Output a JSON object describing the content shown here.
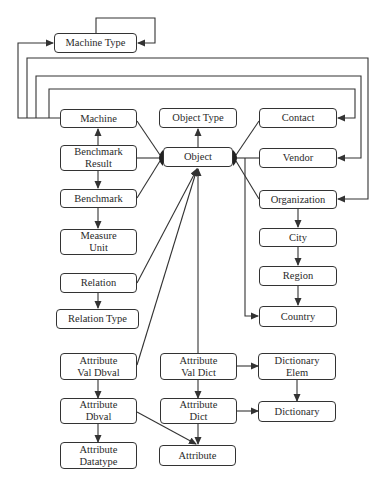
{
  "diagram": {
    "type": "entity-relationship",
    "colors": {
      "line": "#333333",
      "box_border": "#333333",
      "text": "#2a2a2a",
      "background": "#ffffff"
    },
    "nodes": {
      "machine_type": {
        "label": "Machine Type"
      },
      "machine": {
        "label": "Machine"
      },
      "object_type": {
        "label": "Object Type"
      },
      "contact": {
        "label": "Contact"
      },
      "benchmark_result": {
        "label": "Benchmark\nResult"
      },
      "object": {
        "label": "Object"
      },
      "vendor": {
        "label": "Vendor"
      },
      "benchmark": {
        "label": "Benchmark"
      },
      "organization": {
        "label": "Organization"
      },
      "measure_unit": {
        "label": "Measure\nUnit"
      },
      "city": {
        "label": "City"
      },
      "relation": {
        "label": "Relation"
      },
      "region": {
        "label": "Region"
      },
      "relation_type": {
        "label": "Relation Type"
      },
      "country": {
        "label": "Country"
      },
      "attribute_val_dbval": {
        "label": "Attribute\nVal Dbval"
      },
      "attribute_val_dict": {
        "label": "Attribute\nVal Dict"
      },
      "dictionary_elem": {
        "label": "Dictionary\nElem"
      },
      "attribute_dbval": {
        "label": "Attribute\nDbval"
      },
      "attribute_dict": {
        "label": "Attribute\nDict"
      },
      "dictionary": {
        "label": "Dictionary"
      },
      "attribute_datatype": {
        "label": "Attribute\nDatatype"
      },
      "attribute": {
        "label": "Attribute"
      }
    },
    "edges": [
      {
        "from": "Machine Type",
        "to": "Machine Type",
        "kind": "self-loop"
      },
      {
        "from": "Machine",
        "to": "Machine Type"
      },
      {
        "from": "Machine",
        "to": "Contact"
      },
      {
        "from": "Machine",
        "to": "Vendor"
      },
      {
        "from": "Machine",
        "to": "Organization"
      },
      {
        "from": "Benchmark Result",
        "to": "Machine"
      },
      {
        "from": "Benchmark Result",
        "to": "Benchmark"
      },
      {
        "from": "Benchmark",
        "to": "Measure Unit"
      },
      {
        "from": "Object",
        "to": "Object Type"
      },
      {
        "from": "Machine",
        "to": "Object",
        "kind": "inheritance"
      },
      {
        "from": "Benchmark Result",
        "to": "Object",
        "kind": "inheritance"
      },
      {
        "from": "Benchmark",
        "to": "Object",
        "kind": "inheritance"
      },
      {
        "from": "Contact",
        "to": "Object",
        "kind": "inheritance"
      },
      {
        "from": "Vendor",
        "to": "Object",
        "kind": "inheritance"
      },
      {
        "from": "Organization",
        "to": "Object",
        "kind": "inheritance"
      },
      {
        "from": "Country",
        "to": "Object",
        "kind": "inheritance"
      },
      {
        "from": "Organization",
        "to": "City"
      },
      {
        "from": "City",
        "to": "Region"
      },
      {
        "from": "Region",
        "to": "Country"
      },
      {
        "from": "Relation",
        "to": "Object"
      },
      {
        "from": "Relation",
        "to": "Relation Type"
      },
      {
        "from": "Attribute Val Dbval",
        "to": "Object"
      },
      {
        "from": "Attribute Val Dict",
        "to": "Object"
      },
      {
        "from": "Attribute Val Dbval",
        "to": "Attribute Dbval"
      },
      {
        "from": "Attribute Dbval",
        "to": "Attribute Datatype"
      },
      {
        "from": "Attribute Dbval",
        "to": "Attribute"
      },
      {
        "from": "Attribute Val Dict",
        "to": "Attribute Dict"
      },
      {
        "from": "Attribute Val Dict",
        "to": "Dictionary Elem"
      },
      {
        "from": "Attribute Dict",
        "to": "Dictionary"
      },
      {
        "from": "Attribute Dict",
        "to": "Attribute"
      },
      {
        "from": "Dictionary Elem",
        "to": "Dictionary"
      }
    ]
  }
}
